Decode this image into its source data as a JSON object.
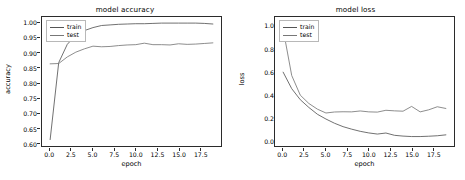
{
  "figure": {
    "background": "#ffffff",
    "line_color_train": "#555555",
    "line_color_test": "#777777",
    "axis_color": "#2b2b2b"
  },
  "chart_data": [
    {
      "type": "line",
      "id": "model-accuracy",
      "title": "model accuracy",
      "xlabel": "epoch",
      "ylabel": "accuracy",
      "xlim": [
        -0.95,
        19.95
      ],
      "ylim": [
        0.5896,
        1.0204
      ],
      "grid": false,
      "legend_position": "upper left",
      "xticks": [
        "0.0",
        "2.5",
        "5.0",
        "7.5",
        "10.0",
        "12.5",
        "15.0",
        "17.5"
      ],
      "xtick_values": [
        0.0,
        2.5,
        5.0,
        7.5,
        10.0,
        12.5,
        15.0,
        17.5
      ],
      "yticks": [
        "1.00",
        "0.95",
        "0.90",
        "0.85",
        "0.80",
        "0.75",
        "0.70",
        "0.65",
        "0.60"
      ],
      "ytick_values": [
        1.0,
        0.95,
        0.9,
        0.85,
        0.8,
        0.75,
        0.7,
        0.65,
        0.6
      ],
      "x": [
        0,
        1,
        2,
        3,
        4,
        5,
        6,
        7,
        8,
        9,
        10,
        11,
        12,
        13,
        14,
        15,
        16,
        17,
        18,
        19
      ],
      "series": [
        {
          "name": "train",
          "values": [
            0.611,
            0.868,
            0.929,
            0.96,
            0.975,
            0.985,
            0.992,
            0.994,
            0.996,
            0.997,
            0.998,
            0.998,
            0.999,
            1.0,
            1.0,
            1.0,
            1.0,
            1.0,
            0.999,
            0.997
          ]
        },
        {
          "name": "test",
          "values": [
            0.864,
            0.865,
            0.887,
            0.903,
            0.914,
            0.923,
            0.921,
            0.922,
            0.925,
            0.927,
            0.928,
            0.933,
            0.928,
            0.928,
            0.927,
            0.931,
            0.929,
            0.93,
            0.932,
            0.934
          ]
        }
      ]
    },
    {
      "type": "line",
      "id": "model-loss",
      "title": "model loss",
      "xlabel": "epoch",
      "ylabel": "loss",
      "xlim": [
        -0.95,
        19.95
      ],
      "ylim": [
        -0.052,
        1.082
      ],
      "grid": false,
      "legend_position": "upper left",
      "xticks": [
        "0.0",
        "2.5",
        "5.0",
        "7.5",
        "10.0",
        "12.5",
        "15.0",
        "17.5"
      ],
      "xtick_values": [
        0.0,
        2.5,
        5.0,
        7.5,
        10.0,
        12.5,
        15.0,
        17.5
      ],
      "yticks": [
        "1.0",
        "0.8",
        "0.6",
        "0.4",
        "0.2",
        "0.0"
      ],
      "ytick_values": [
        1.0,
        0.8,
        0.6,
        0.4,
        0.2,
        0.0
      ],
      "x": [
        0,
        1,
        2,
        3,
        4,
        5,
        6,
        7,
        8,
        9,
        10,
        11,
        12,
        13,
        14,
        15,
        16,
        17,
        18,
        19
      ],
      "series": [
        {
          "name": "train",
          "values": [
            0.597,
            0.452,
            0.355,
            0.287,
            0.227,
            0.185,
            0.148,
            0.118,
            0.096,
            0.077,
            0.063,
            0.053,
            0.062,
            0.042,
            0.035,
            0.031,
            0.031,
            0.034,
            0.038,
            0.046
          ]
        },
        {
          "name": "test",
          "values": [
            0.975,
            0.568,
            0.395,
            0.322,
            0.272,
            0.238,
            0.247,
            0.249,
            0.248,
            0.256,
            0.248,
            0.246,
            0.262,
            0.257,
            0.254,
            0.296,
            0.248,
            0.266,
            0.293,
            0.278
          ]
        }
      ]
    }
  ],
  "legend": {
    "entries": [
      "train",
      "test"
    ]
  }
}
